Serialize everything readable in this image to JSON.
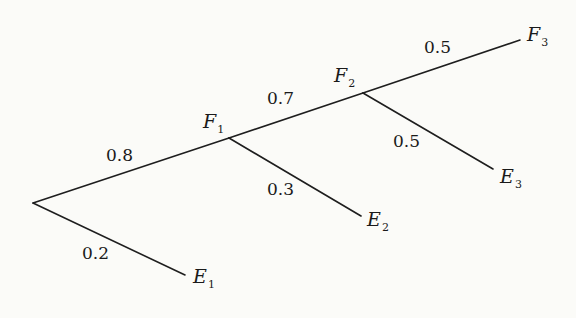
{
  "diagram": {
    "type": "probability-tree",
    "nodes": {
      "F1": {
        "letter": "F",
        "sub": "1"
      },
      "F2": {
        "letter": "F",
        "sub": "2"
      },
      "F3": {
        "letter": "F",
        "sub": "3"
      },
      "E1": {
        "letter": "E",
        "sub": "1"
      },
      "E2": {
        "letter": "E",
        "sub": "2"
      },
      "E3": {
        "letter": "E",
        "sub": "3"
      }
    },
    "edges": [
      {
        "from": "root",
        "to": "F1",
        "prob": "0.8"
      },
      {
        "from": "root",
        "to": "E1",
        "prob": "0.2"
      },
      {
        "from": "F1",
        "to": "F2",
        "prob": "0.7"
      },
      {
        "from": "F1",
        "to": "E2",
        "prob": "0.3"
      },
      {
        "from": "F2",
        "to": "F3",
        "prob": "0.5"
      },
      {
        "from": "F2",
        "to": "E3",
        "prob": "0.5"
      }
    ]
  }
}
